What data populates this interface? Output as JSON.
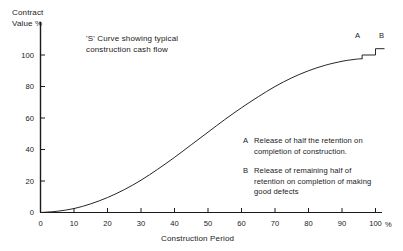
{
  "chart_data": {
    "type": "line",
    "title": "'S' Curve showing typical\nconstruction cash flow",
    "xlabel": "Construction Period",
    "ylabel": "Contract\nValue %",
    "xunit": "%",
    "xlim": [
      0,
      103
    ],
    "ylim": [
      0,
      108
    ],
    "grid": false,
    "legend_position": "inside-lower-right",
    "x_ticks": [
      "0",
      "10",
      "20",
      "30",
      "40",
      "50",
      "60",
      "70",
      "80",
      "90",
      "100"
    ],
    "x_tick_values": [
      0,
      10,
      20,
      30,
      40,
      50,
      60,
      70,
      80,
      90,
      100
    ],
    "y_ticks": [
      "0",
      "20",
      "40",
      "60",
      "80",
      "100"
    ],
    "y_tick_values": [
      0,
      20,
      40,
      60,
      80,
      100
    ],
    "series": [
      {
        "name": "Cumulative contract value",
        "x": [
          0,
          5,
          10,
          15,
          20,
          25,
          30,
          35,
          40,
          45,
          50,
          55,
          60,
          65,
          70,
          75,
          80,
          85,
          90,
          93,
          95,
          96
        ],
        "values": [
          0,
          0.8,
          2.5,
          5.5,
          9.5,
          14.5,
          20.5,
          27.5,
          35,
          43,
          51,
          59,
          66.5,
          73.5,
          80,
          85.5,
          90,
          93.5,
          96,
          97,
          97.5,
          97.6
        ]
      }
    ],
    "annotations": [
      {
        "key": "A",
        "x": 96,
        "y": 97.6,
        "step_to": 100,
        "label": "A"
      },
      {
        "key": "B",
        "x": 100,
        "y": 100,
        "step_to": 104,
        "label": "B"
      }
    ]
  },
  "notes": [
    {
      "key": "A",
      "text": "Release of half the retention on\ncompletion of construction."
    },
    {
      "key": "B",
      "text": "Release of remaining half of\nretention on completion of making\ngood defects"
    }
  ]
}
